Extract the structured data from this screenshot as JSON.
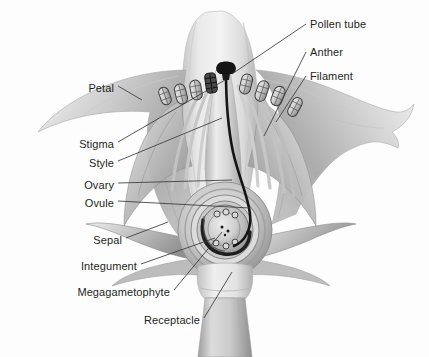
{
  "figure": {
    "background_color": "#fdfdfd",
    "label_color": "#231f20",
    "leader_color": "#3a3a3a"
  },
  "labels": {
    "petal": "Petal",
    "stigma": "Stigma",
    "style": "Style",
    "ovary": "Ovary",
    "ovule": "Ovule",
    "sepal": "Sepal",
    "integument": "Integument",
    "megagametophyte": "Megagametophyte",
    "receptacle": "Receptacle",
    "pollen_tube": "Pollen tube",
    "anther": "Anther",
    "filament": "Filament"
  },
  "label_layout": {
    "left": [
      {
        "key": "petal",
        "text": "Petal",
        "x": 75,
        "y": 82,
        "right_edge": 114
      },
      {
        "key": "stigma",
        "text": "Stigma",
        "x": 62,
        "y": 138,
        "right_edge": 114
      },
      {
        "key": "style",
        "text": "Style",
        "x": 75,
        "y": 157,
        "right_edge": 114
      },
      {
        "key": "ovary",
        "text": "Ovary",
        "x": 70,
        "y": 179,
        "right_edge": 114
      },
      {
        "key": "ovule",
        "text": "Ovule",
        "x": 70,
        "y": 197,
        "right_edge": 114
      },
      {
        "key": "sepal",
        "text": "Sepal",
        "x": 82,
        "y": 234,
        "right_edge": 122
      },
      {
        "key": "integument",
        "text": "Integument",
        "x": 57,
        "y": 260,
        "right_edge": 137
      },
      {
        "key": "megagametophyte",
        "text": "Megagametophyte",
        "x": 45,
        "y": 286,
        "right_edge": 170
      },
      {
        "key": "receptacle",
        "text": "Receptacle",
        "x": 130,
        "y": 321,
        "right_edge": 200
      }
    ],
    "right": [
      {
        "key": "pollen_tube",
        "text": "Pollen tube",
        "x": 310,
        "y": 21
      },
      {
        "key": "anther",
        "text": "Anther",
        "x": 310,
        "y": 49
      },
      {
        "key": "filament",
        "text": "Filament",
        "x": 310,
        "y": 73
      }
    ]
  },
  "structures": {
    "petals": {
      "count": 5,
      "fill_light": "#e8e8e8",
      "fill_mid": "#c9c9c9",
      "fill_dark": "#a3a3a3"
    },
    "sepals": {
      "count": 4,
      "fill": "#bdbdbd"
    },
    "stamens": {
      "count": 7,
      "anther_fill": "#d4d4d4",
      "anther_stroke": "#4a4a4a"
    },
    "stigma": {
      "fill": "#1a1a1a"
    },
    "style": {
      "fill": "#dcdcdc"
    },
    "pollen_tube": {
      "stroke": "#141414",
      "width": 2.4
    },
    "ovary": {
      "fill": "#cfcfcf"
    },
    "ovule": {
      "fill": "#bdbdbd"
    },
    "megagametophyte": {
      "fill": "#d8d8d8"
    },
    "integument": {
      "stroke": "#2b2b2b"
    },
    "receptacle": {
      "fill": "#dedede"
    },
    "pedicel": {
      "fill": "#c4c4c4"
    }
  }
}
